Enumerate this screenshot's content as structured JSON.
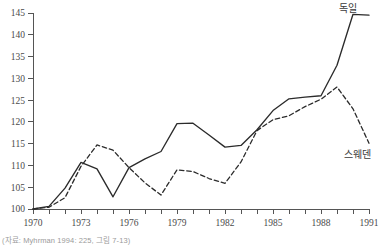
{
  "chart_data": {
    "type": "line",
    "title": "",
    "subtitle": "",
    "xlabel": "",
    "ylabel": "",
    "xlim": [
      1970,
      1991
    ],
    "ylim": [
      100,
      145
    ],
    "grid": false,
    "legend_position": "inline-right-end-labels",
    "x": [
      1970,
      1971,
      1972,
      1973,
      1974,
      1975,
      1976,
      1977,
      1978,
      1979,
      1980,
      1981,
      1982,
      1983,
      1984,
      1985,
      1986,
      1987,
      1988,
      1989,
      1990,
      1991
    ],
    "xticks_major": [
      1970,
      1973,
      1976,
      1979,
      1982,
      1985,
      1988,
      1991
    ],
    "xticks_minor": [
      1971,
      1972,
      1974,
      1975,
      1977,
      1978,
      1980,
      1981,
      1983,
      1984,
      1986,
      1987,
      1989,
      1990
    ],
    "yticks": [
      100,
      105,
      110,
      115,
      120,
      125,
      130,
      135,
      140,
      145
    ],
    "series": [
      {
        "name": "독일",
        "style": "solid",
        "color": "#2b2b2b",
        "label_position": "top-right",
        "values": [
          100.0,
          100.6,
          104.8,
          110.7,
          109.2,
          102.8,
          109.5,
          111.5,
          113.2,
          119.6,
          119.7,
          117.0,
          114.2,
          114.6,
          118.2,
          122.6,
          125.3,
          125.7,
          126.0,
          133.0,
          144.7,
          144.5
        ]
      },
      {
        "name": "스웨덴",
        "style": "dashed",
        "color": "#2b2b2b",
        "label_position": "bottom-right",
        "values": [
          100.0,
          100.4,
          102.6,
          109.8,
          114.7,
          113.5,
          109.5,
          106.0,
          103.2,
          109.0,
          108.6,
          107.0,
          105.9,
          110.8,
          118.0,
          120.5,
          121.4,
          123.5,
          125.2,
          128.0,
          123.0,
          115.1
        ]
      }
    ]
  },
  "axes": {
    "y_tick_labels": [
      "100",
      "105",
      "110",
      "115",
      "120",
      "125",
      "130",
      "135",
      "140",
      "145"
    ],
    "x_tick_labels": [
      "1970",
      "1973",
      "1976",
      "1979",
      "1982",
      "1985",
      "1988",
      "1991"
    ]
  },
  "annotations": {
    "germany_label": "독일",
    "sweden_label": "스웨덴"
  },
  "source": {
    "note": "(자료: Myhrman 1994: 225, 그림 7-13)"
  }
}
